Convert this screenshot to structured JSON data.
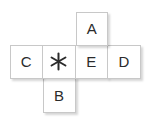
{
  "figure": {
    "name": "cross-shaped-tile-puzzle",
    "grid": {
      "columns": 4,
      "rows": 3,
      "cell_size_px": 33
    },
    "colors": {
      "tile_background": "#ffffff",
      "tile_border": "#c8c8c8",
      "text": "#2b2b2b",
      "page_background": "#ffffff",
      "shadow": "rgba(0,0,0,0.16)"
    },
    "cells": [
      {
        "id": "cell-a",
        "row": 1,
        "col": 3,
        "type": "letter",
        "label": "A",
        "icon": ""
      },
      {
        "id": "cell-c",
        "row": 2,
        "col": 1,
        "type": "letter",
        "label": "C",
        "icon": ""
      },
      {
        "id": "cell-asterisk",
        "row": 2,
        "col": 2,
        "type": "icon",
        "label": "",
        "icon": "asterisk-icon"
      },
      {
        "id": "cell-e",
        "row": 2,
        "col": 3,
        "type": "letter",
        "label": "E",
        "icon": ""
      },
      {
        "id": "cell-d",
        "row": 2,
        "col": 4,
        "type": "letter",
        "label": "D",
        "icon": ""
      },
      {
        "id": "cell-b",
        "row": 3,
        "col": 2,
        "type": "letter",
        "label": "B",
        "icon": ""
      }
    ]
  }
}
